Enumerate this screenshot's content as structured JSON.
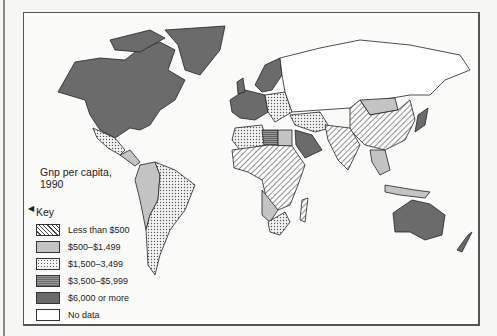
{
  "map": {
    "title_line1": "Gnp per capita,",
    "title_line2": "1990",
    "key_title": "Key",
    "legend": [
      {
        "label": "Less than $500",
        "pattern": "diagonal-hatch",
        "color": "#444444"
      },
      {
        "label": "$500–$1,499",
        "pattern": "light-gray",
        "color": "#c4c4c4"
      },
      {
        "label": "$1,500–3,499",
        "pattern": "dotted",
        "color": "#555555"
      },
      {
        "label": "$3,500–$5,999",
        "pattern": "horizontal-stripe",
        "color": "#7a7a7a"
      },
      {
        "label": "$6,000 or more",
        "pattern": "dark-gray",
        "color": "#6b6b6b"
      },
      {
        "label": "No data",
        "pattern": "white",
        "color": "#ffffff"
      }
    ],
    "regions": [
      {
        "name": "North America (USA, Canada)",
        "category": "$6,000 or more"
      },
      {
        "name": "Greenland",
        "category": "$6,000 or more"
      },
      {
        "name": "Mexico",
        "category": "$1,500–3,499"
      },
      {
        "name": "Central America",
        "category": "$500–$1,499"
      },
      {
        "name": "Brazil / Southern South America",
        "category": "$1,500–3,499"
      },
      {
        "name": "Andean South America",
        "category": "$500–$1,499"
      },
      {
        "name": "Western Europe",
        "category": "$6,000 or more"
      },
      {
        "name": "Scandinavia",
        "category": "$6,000 or more"
      },
      {
        "name": "Eastern Europe",
        "category": "$1,500–3,499"
      },
      {
        "name": "USSR",
        "category": "No data"
      },
      {
        "name": "Sub-Saharan Africa",
        "category": "Less than $500"
      },
      {
        "name": "Libya",
        "category": "$3,500–$5,999"
      },
      {
        "name": "Saudi Arabia",
        "category": "$6,000 or more"
      },
      {
        "name": "Iran / Turkey",
        "category": "$1,500–3,499"
      },
      {
        "name": "South Africa",
        "category": "$1,500–3,499"
      },
      {
        "name": "China / India",
        "category": "Less than $500"
      },
      {
        "name": "Mongolia",
        "category": "$500–$1,499"
      },
      {
        "name": "Japan",
        "category": "$6,000 or more"
      },
      {
        "name": "Southeast Asia",
        "category": "$500–$1,499"
      },
      {
        "name": "Madagascar",
        "category": "Less than $500"
      },
      {
        "name": "Australia",
        "category": "$6,000 or more"
      },
      {
        "name": "New Zealand",
        "category": "$6,000 or more"
      }
    ]
  }
}
